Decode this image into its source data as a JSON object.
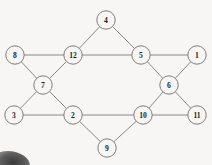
{
  "diagram": {
    "background_color": "#f7f6f4",
    "edge_color": "#7a7a78",
    "node_fill": "#f7f6f4",
    "node_stroke": "#6f6f6d",
    "label_color": "#1d1d1d",
    "node_radius": 9.2,
    "nodes": [
      {
        "id": "n1",
        "label": "1",
        "x": 197,
        "y": 55
      },
      {
        "id": "n2",
        "label": "2",
        "x": 73,
        "y": 115
      },
      {
        "id": "n3",
        "label": "3",
        "x": 14,
        "y": 115
      },
      {
        "id": "n4",
        "label": "4",
        "x": 106,
        "y": 20
      },
      {
        "id": "n5",
        "label": "5",
        "x": 141,
        "y": 55
      },
      {
        "id": "n6",
        "label": "6",
        "x": 169,
        "y": 85
      },
      {
        "id": "n7",
        "label": "7",
        "x": 43,
        "y": 85
      },
      {
        "id": "n8",
        "label": "8",
        "x": 15,
        "y": 55
      },
      {
        "id": "n9",
        "label": "9",
        "x": 107,
        "y": 148
      },
      {
        "id": "n10",
        "label": "10",
        "x": 143,
        "y": 115
      },
      {
        "id": "n11",
        "label": "11",
        "x": 197,
        "y": 115
      },
      {
        "id": "n12",
        "label": "12",
        "x": 73,
        "y": 55
      }
    ],
    "edges": [
      {
        "source": "n8",
        "target": "n12"
      },
      {
        "source": "n12",
        "target": "n5"
      },
      {
        "source": "n5",
        "target": "n1"
      },
      {
        "source": "n3",
        "target": "n2"
      },
      {
        "source": "n2",
        "target": "n10"
      },
      {
        "source": "n10",
        "target": "n11"
      },
      {
        "source": "n4",
        "target": "n12"
      },
      {
        "source": "n4",
        "target": "n5"
      },
      {
        "source": "n9",
        "target": "n2"
      },
      {
        "source": "n9",
        "target": "n10"
      },
      {
        "source": "n7",
        "target": "n8"
      },
      {
        "source": "n7",
        "target": "n12"
      },
      {
        "source": "n7",
        "target": "n3"
      },
      {
        "source": "n7",
        "target": "n2"
      },
      {
        "source": "n6",
        "target": "n5"
      },
      {
        "source": "n6",
        "target": "n1"
      },
      {
        "source": "n6",
        "target": "n10"
      },
      {
        "source": "n6",
        "target": "n11"
      }
    ]
  }
}
